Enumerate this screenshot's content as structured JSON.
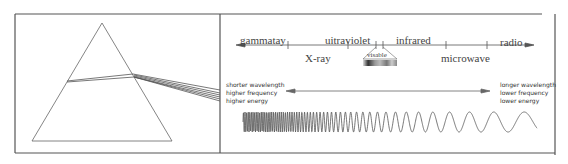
{
  "diagram": {
    "left_panel": {
      "subject": "prism-dispersion"
    },
    "spectrum_axis": {
      "labels_above": [
        "gammatay",
        "uitraviolet",
        "infrared",
        "radio"
      ],
      "labels_below": [
        "X-ray",
        "microwave"
      ],
      "visible_label": "visable"
    },
    "direction_arrow": {
      "left_text": [
        "shorter wavelength",
        "higher frequency",
        "higher energy"
      ],
      "right_text": [
        "longer wavelength",
        "lower frequency",
        "lower energy"
      ]
    }
  }
}
